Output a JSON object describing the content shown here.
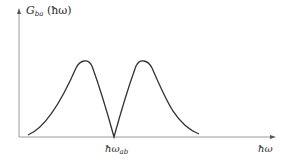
{
  "diagram": {
    "y_axis": {
      "label_main": "G",
      "label_sub": "ba",
      "label_arg": " (ħω)"
    },
    "x_axis": {
      "label": "ħω"
    },
    "marker": {
      "label_main": "ħω",
      "label_sub": "ab"
    },
    "colors": {
      "axis": "#9a9a9a",
      "curve": "#333333",
      "text": "#2a2a2a"
    },
    "curve_description": "Two symmetric peaks separated by a sharp dip to zero at ħω_ab"
  }
}
